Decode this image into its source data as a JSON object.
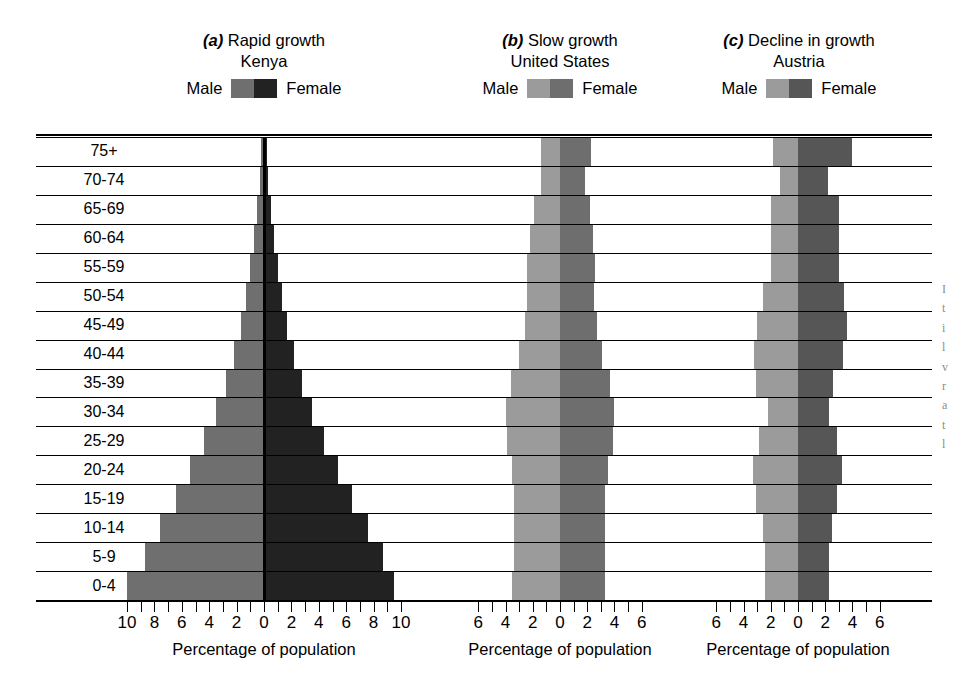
{
  "figure": {
    "axis_title": "Percentage of population",
    "age_groups": [
      "75+",
      "70-74",
      "65-69",
      "60-64",
      "55-59",
      "50-54",
      "45-49",
      "40-44",
      "35-39",
      "30-34",
      "25-29",
      "20-24",
      "15-19",
      "10-14",
      "5-9",
      "0-4"
    ],
    "legend_male": "Male",
    "legend_female": "Female"
  },
  "panels": [
    {
      "id": "a",
      "letter": "(a)",
      "descriptor": "Rapid growth",
      "country": "Kenya",
      "male_color": "#6f6f6f",
      "female_color": "#222222",
      "ticks": [
        "10",
        "8",
        "6",
        "4",
        "2",
        "0",
        "2",
        "4",
        "6",
        "8",
        "10"
      ]
    },
    {
      "id": "b",
      "letter": "(b)",
      "descriptor": "Slow growth",
      "country": "United States",
      "male_color": "#9b9b9b",
      "female_color": "#6e6e6e",
      "ticks": [
        "6",
        "4",
        "2",
        "0",
        "2",
        "4",
        "6"
      ]
    },
    {
      "id": "c",
      "letter": "(c)",
      "descriptor": "Decline in growth",
      "country": "Austria",
      "male_color": "#9b9b9b",
      "female_color": "#565656",
      "ticks": [
        "6",
        "4",
        "2",
        "0",
        "2",
        "4",
        "6"
      ]
    }
  ],
  "chart_data": [
    {
      "type": "bar",
      "chart_style": "population-pyramid",
      "title": "(a) Rapid growth — Kenya",
      "xlabel": "Percentage of population",
      "ylabel": "Age group",
      "xlim": [
        -10.5,
        10.5
      ],
      "xticks": [
        -10,
        -9,
        -8,
        -7,
        -6,
        -5,
        -4,
        -3,
        -2,
        -1,
        0,
        1,
        2,
        3,
        4,
        5,
        6,
        7,
        8,
        9,
        10
      ],
      "xtick_labels": [
        "10",
        "",
        "8",
        "",
        "6",
        "",
        "4",
        "",
        "2",
        "",
        "0",
        "",
        "2",
        "",
        "4",
        "",
        "6",
        "",
        "8",
        "",
        "10"
      ],
      "grid": true,
      "legend": [
        "Male",
        "Female"
      ],
      "legend_position": "above-plot",
      "categories": [
        "75+",
        "70-74",
        "65-69",
        "60-64",
        "55-59",
        "50-54",
        "45-49",
        "40-44",
        "35-39",
        "30-34",
        "25-29",
        "20-24",
        "15-19",
        "10-14",
        "5-9",
        "0-4"
      ],
      "series": [
        {
          "name": "Male",
          "side": "left",
          "values": [
            0.2,
            0.3,
            0.5,
            0.7,
            1.0,
            1.3,
            1.7,
            2.2,
            2.8,
            3.5,
            4.4,
            5.4,
            6.4,
            7.6,
            8.7,
            10.0
          ]
        },
        {
          "name": "Female",
          "side": "right",
          "values": [
            0.2,
            0.3,
            0.5,
            0.7,
            1.0,
            1.3,
            1.7,
            2.2,
            2.8,
            3.5,
            4.4,
            5.4,
            6.4,
            7.6,
            8.7,
            9.5
          ]
        }
      ]
    },
    {
      "type": "bar",
      "chart_style": "population-pyramid",
      "title": "(b) Slow growth — United States",
      "xlabel": "Percentage of population",
      "ylabel": "Age group",
      "xlim": [
        -7.0,
        7.0
      ],
      "xticks": [
        -6,
        -5,
        -4,
        -3,
        -2,
        -1,
        0,
        1,
        2,
        3,
        4,
        5,
        6
      ],
      "xtick_labels": [
        "6",
        "",
        "4",
        "",
        "2",
        "",
        "0",
        "",
        "2",
        "",
        "4",
        "",
        "6"
      ],
      "grid": true,
      "legend": [
        "Male",
        "Female"
      ],
      "legend_position": "above-plot",
      "categories": [
        "75+",
        "70-74",
        "65-69",
        "60-64",
        "55-59",
        "50-54",
        "45-49",
        "40-44",
        "35-39",
        "30-34",
        "25-29",
        "20-24",
        "15-19",
        "10-14",
        "5-9",
        "0-4"
      ],
      "series": [
        {
          "name": "Male",
          "side": "left",
          "values": [
            1.4,
            1.4,
            1.9,
            2.2,
            2.4,
            2.4,
            2.6,
            3.0,
            3.6,
            4.0,
            3.9,
            3.5,
            3.4,
            3.4,
            3.4,
            3.5
          ]
        },
        {
          "name": "Female",
          "side": "right",
          "values": [
            2.3,
            1.8,
            2.2,
            2.4,
            2.6,
            2.5,
            2.7,
            3.1,
            3.7,
            4.0,
            3.9,
            3.5,
            3.3,
            3.3,
            3.3,
            3.3
          ]
        }
      ]
    },
    {
      "type": "bar",
      "chart_style": "population-pyramid",
      "title": "(c) Decline in growth — Austria",
      "xlabel": "Percentage of population",
      "ylabel": "Age group",
      "xlim": [
        -7.0,
        7.0
      ],
      "xticks": [
        -6,
        -5,
        -4,
        -3,
        -2,
        -1,
        0,
        1,
        2,
        3,
        4,
        5,
        6
      ],
      "xtick_labels": [
        "6",
        "",
        "4",
        "",
        "2",
        "",
        "0",
        "",
        "2",
        "",
        "4",
        "",
        "6"
      ],
      "grid": true,
      "legend": [
        "Male",
        "Female"
      ],
      "legend_position": "above-plot",
      "categories": [
        "75+",
        "70-74",
        "65-69",
        "60-64",
        "55-59",
        "50-54",
        "45-49",
        "40-44",
        "35-39",
        "30-34",
        "25-29",
        "20-24",
        "15-19",
        "10-14",
        "5-9",
        "0-4"
      ],
      "series": [
        {
          "name": "Male",
          "side": "left",
          "values": [
            1.8,
            1.3,
            2.0,
            2.0,
            2.0,
            2.6,
            3.0,
            3.2,
            3.1,
            2.2,
            2.9,
            3.3,
            3.1,
            2.6,
            2.4,
            2.4
          ]
        },
        {
          "name": "Female",
          "side": "right",
          "values": [
            4.0,
            2.2,
            3.0,
            3.0,
            3.0,
            3.4,
            3.6,
            3.3,
            2.6,
            2.3,
            2.9,
            3.2,
            2.9,
            2.5,
            2.3,
            2.3
          ]
        }
      ]
    }
  ]
}
